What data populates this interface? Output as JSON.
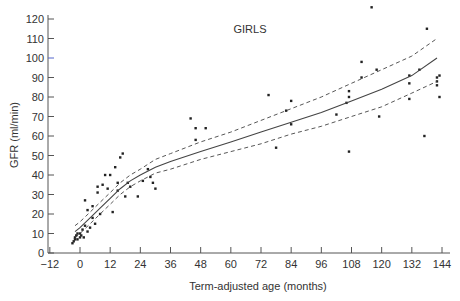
{
  "chart_data": {
    "type": "scatter",
    "title": "GIRLS",
    "xlabel": "Term-adjusted age (months)",
    "ylabel": "GFR (ml/min)",
    "xlim": [
      -12,
      144
    ],
    "ylim": [
      0,
      120
    ],
    "xticks": [
      -12,
      0,
      12,
      24,
      36,
      48,
      60,
      72,
      84,
      96,
      108,
      120,
      132,
      144
    ],
    "xtick_labels": [
      "−12",
      "0",
      "12",
      "24",
      "36",
      "48",
      "60",
      "72",
      "84",
      "96",
      "108",
      "120",
      "132",
      "144"
    ],
    "yticks": [
      0,
      10,
      20,
      30,
      40,
      50,
      60,
      70,
      80,
      90,
      100,
      110,
      120
    ],
    "grid": false,
    "legend": null,
    "series": [
      {
        "name": "Observed GFR",
        "kind": "scatter",
        "points": [
          [
            -3,
            5
          ],
          [
            -2.5,
            6
          ],
          [
            -2,
            7
          ],
          [
            -2,
            8
          ],
          [
            -1.5,
            9
          ],
          [
            -1,
            10
          ],
          [
            -1,
            7
          ],
          [
            0,
            8
          ],
          [
            0,
            10
          ],
          [
            0.5,
            9
          ],
          [
            1,
            12
          ],
          [
            1.5,
            8
          ],
          [
            2,
            14
          ],
          [
            2,
            27
          ],
          [
            3,
            22
          ],
          [
            3,
            11
          ],
          [
            4,
            13
          ],
          [
            5,
            18
          ],
          [
            5,
            24
          ],
          [
            6,
            15
          ],
          [
            7,
            31
          ],
          [
            7,
            34
          ],
          [
            8,
            20
          ],
          [
            9,
            35
          ],
          [
            10,
            40
          ],
          [
            11,
            33
          ],
          [
            12,
            40
          ],
          [
            13,
            21
          ],
          [
            14,
            44
          ],
          [
            15,
            36
          ],
          [
            15,
            32
          ],
          [
            16,
            49
          ],
          [
            17,
            51
          ],
          [
            18,
            29
          ],
          [
            19,
            36
          ],
          [
            20,
            34
          ],
          [
            23,
            29
          ],
          [
            25,
            37
          ],
          [
            27,
            43
          ],
          [
            28,
            39
          ],
          [
            29,
            36
          ],
          [
            30,
            33
          ],
          [
            44,
            69
          ],
          [
            46,
            64
          ],
          [
            46,
            58
          ],
          [
            50,
            64
          ],
          [
            75,
            81
          ],
          [
            78,
            54
          ],
          [
            82,
            73
          ],
          [
            84,
            78
          ],
          [
            84,
            66
          ],
          [
            102,
            71
          ],
          [
            106,
            77
          ],
          [
            107,
            83
          ],
          [
            107,
            80
          ],
          [
            107,
            52
          ],
          [
            112,
            98
          ],
          [
            112,
            90
          ],
          [
            116,
            126
          ],
          [
            118,
            94
          ],
          [
            119,
            70
          ],
          [
            131,
            91
          ],
          [
            131,
            87
          ],
          [
            131,
            79
          ],
          [
            135,
            94
          ],
          [
            137,
            60
          ],
          [
            138,
            115
          ],
          [
            142,
            88
          ],
          [
            142,
            86
          ],
          [
            142,
            90
          ],
          [
            143,
            91
          ],
          [
            143,
            80
          ]
        ]
      },
      {
        "name": "Fitted mean",
        "kind": "line",
        "style": "solid",
        "x": [
          -2,
          0,
          4,
          8,
          12,
          16,
          20,
          24,
          30,
          36,
          48,
          60,
          72,
          84,
          96,
          108,
          120,
          132,
          142
        ],
        "y": [
          11,
          13,
          18,
          23,
          28,
          33,
          37,
          40,
          44,
          47,
          52,
          57,
          62,
          67,
          72,
          78,
          84,
          91,
          100
        ]
      },
      {
        "name": "Upper confidence band",
        "kind": "line",
        "style": "dashed",
        "x": [
          -2,
          0,
          4,
          8,
          12,
          16,
          20,
          24,
          30,
          36,
          48,
          60,
          72,
          84,
          96,
          108,
          120,
          132,
          142
        ],
        "y": [
          14,
          16,
          21,
          26,
          31,
          36,
          40,
          43,
          48,
          51,
          57,
          62,
          68,
          74,
          80,
          87,
          94,
          101,
          110
        ]
      },
      {
        "name": "Lower confidence band",
        "kind": "line",
        "style": "dashed",
        "x": [
          -2,
          0,
          4,
          8,
          12,
          16,
          20,
          24,
          30,
          36,
          48,
          60,
          72,
          84,
          96,
          108,
          120,
          132,
          142
        ],
        "y": [
          8,
          10,
          15,
          20,
          25,
          30,
          34,
          37,
          41,
          43,
          48,
          52,
          56,
          61,
          65,
          70,
          75,
          82,
          88
        ]
      }
    ]
  },
  "colors": {
    "axis": "#555555",
    "points": "#222222",
    "line": "#444444",
    "tick_accent": "#5566cc"
  }
}
